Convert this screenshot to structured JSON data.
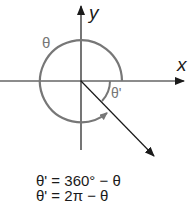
{
  "diagram": {
    "axes": {
      "x_label": "x",
      "y_label": "y"
    },
    "angles": {
      "theta_label": "θ",
      "reference_label": "θ'"
    },
    "formulas": [
      "θ' = 360° − θ",
      "θ' = 2π − θ"
    ],
    "colors": {
      "axis": "#1a1a1a",
      "arc": "#777777",
      "label_gray": "#777777",
      "text": "#1a1a1a"
    }
  }
}
